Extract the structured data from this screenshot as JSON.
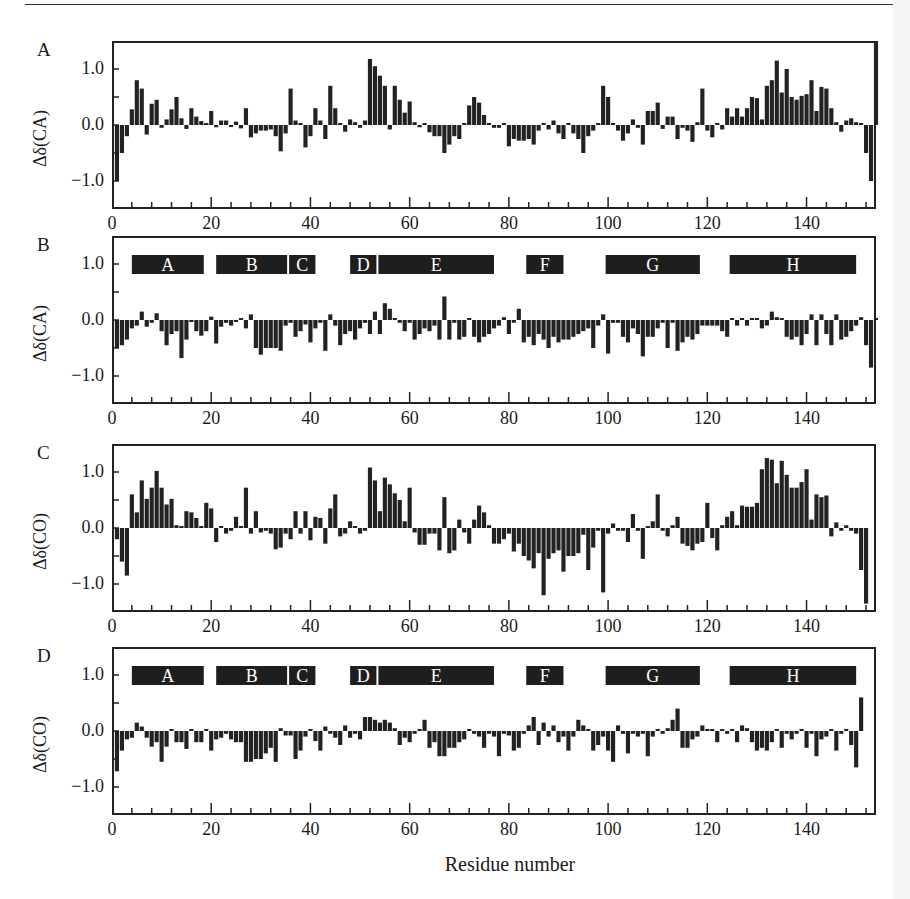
{
  "figure": {
    "xlabel": "Residue number",
    "x_ticks": [
      "0",
      "20",
      "40",
      "60",
      "80",
      "100",
      "120",
      "140"
    ],
    "y_ticks": [
      "1.0",
      "0.0",
      "−1.0"
    ]
  },
  "panels": [
    {
      "label": "A",
      "ylabel": "Δδ(CA)"
    },
    {
      "label": "B",
      "ylabel": "Δδ(CA)"
    },
    {
      "label": "C",
      "ylabel": "Δδ(CO)"
    },
    {
      "label": "D",
      "ylabel": "Δδ(CO)"
    }
  ],
  "helices": [
    {
      "name": "A",
      "start": 4,
      "end": 18.5
    },
    {
      "name": "B",
      "start": 21,
      "end": 35.3
    },
    {
      "name": "C",
      "start": 35.7,
      "end": 41
    },
    {
      "name": "D",
      "start": 48,
      "end": 53.3
    },
    {
      "name": "E",
      "start": 53.7,
      "end": 77
    },
    {
      "name": "F",
      "start": 83.5,
      "end": 91
    },
    {
      "name": "G",
      "start": 99.5,
      "end": 118.5
    },
    {
      "name": "H",
      "start": 124.5,
      "end": 150
    }
  ],
  "chart_data": [
    {
      "type": "bar",
      "title": "A",
      "xlabel": "Residue number",
      "ylabel": "Δδ(CA)",
      "xlim": [
        0,
        154
      ],
      "ylim": [
        -1.5,
        1.5
      ],
      "grid": false,
      "x_start": 1,
      "values": [
        -1.0,
        -0.5,
        -0.2,
        0.28,
        0.8,
        0.65,
        -0.17,
        0.38,
        0.45,
        -0.05,
        0.1,
        0.28,
        0.5,
        0.12,
        -0.07,
        0.3,
        0.15,
        0.07,
        0.0,
        0.25,
        -0.04,
        0.08,
        0.08,
        -0.02,
        0.06,
        -0.06,
        0.3,
        -0.22,
        -0.15,
        -0.1,
        -0.1,
        -0.08,
        -0.2,
        -0.47,
        -0.15,
        0.65,
        0.08,
        0.0,
        -0.4,
        -0.2,
        0.3,
        0.08,
        -0.25,
        0.7,
        0.3,
        0.0,
        -0.12,
        0.1,
        0.05,
        -0.05,
        0.08,
        1.18,
        1.05,
        0.88,
        0.7,
        -0.08,
        0.7,
        0.45,
        0.22,
        0.42,
        0.05,
        -0.04,
        0.02,
        -0.13,
        -0.2,
        -0.2,
        -0.5,
        -0.35,
        -0.2,
        -0.25,
        0.0,
        0.35,
        0.5,
        0.4,
        0.18,
        0.0,
        -0.05,
        -0.05,
        0.0,
        -0.38,
        -0.25,
        -0.28,
        -0.28,
        -0.25,
        -0.35,
        -0.1,
        0.0,
        -0.08,
        0.08,
        -0.15,
        -0.25,
        0.0,
        -0.15,
        -0.25,
        -0.5,
        -0.2,
        -0.1,
        0.0,
        0.7,
        0.5,
        0.0,
        -0.1,
        -0.28,
        -0.15,
        0.1,
        -0.05,
        -0.35,
        0.25,
        0.25,
        0.4,
        -0.07,
        0.15,
        0.15,
        -0.25,
        -0.05,
        -0.1,
        -0.3,
        0.05,
        0.65,
        -0.1,
        -0.22,
        0.02,
        -0.08,
        0.3,
        0.15,
        0.3,
        0.15,
        0.3,
        0.5,
        0.48,
        0.1,
        0.7,
        0.8,
        1.15,
        0.58,
        1.0,
        0.5,
        0.45,
        0.52,
        0.55,
        0.8,
        0.25,
        0.68,
        0.65,
        0.3,
        0.05,
        -0.12,
        0.08,
        0.12,
        0.05,
        0.0,
        -0.5,
        -1.0,
        1.5
      ]
    },
    {
      "type": "bar",
      "title": "B",
      "xlabel": "Residue number",
      "ylabel": "Δδ(CA)",
      "xlim": [
        0,
        154
      ],
      "ylim": [
        -1.5,
        1.5
      ],
      "grid": false,
      "x_start": 1,
      "values": [
        -0.5,
        -0.45,
        -0.35,
        -0.15,
        -0.1,
        0.15,
        -0.12,
        -0.05,
        0.12,
        -0.2,
        -0.45,
        -0.25,
        -0.2,
        -0.68,
        -0.35,
        -0.03,
        -0.2,
        -0.28,
        -0.2,
        0.06,
        -0.42,
        -0.12,
        -0.05,
        -0.1,
        -0.02,
        0.02,
        -0.15,
        0.1,
        -0.5,
        -0.62,
        -0.5,
        -0.5,
        -0.5,
        -0.55,
        -0.1,
        -0.05,
        -0.3,
        -0.2,
        -0.08,
        -0.4,
        -0.15,
        -0.05,
        -0.55,
        0.1,
        -0.1,
        -0.45,
        -0.25,
        -0.2,
        -0.35,
        -0.15,
        -0.05,
        -0.25,
        0.15,
        -0.25,
        0.3,
        0.2,
        0.0,
        -0.05,
        -0.2,
        -0.05,
        -0.35,
        -0.25,
        -0.15,
        -0.2,
        -0.1,
        -0.35,
        0.42,
        -0.35,
        -0.05,
        -0.35,
        -0.3,
        0.0,
        -0.3,
        -0.4,
        -0.3,
        -0.25,
        -0.15,
        -0.1,
        0.05,
        -0.25,
        -0.05,
        0.2,
        -0.4,
        -0.3,
        -0.45,
        -0.25,
        -0.35,
        -0.5,
        -0.3,
        -0.4,
        -0.35,
        -0.35,
        -0.3,
        -0.25,
        -0.2,
        -0.15,
        -0.5,
        -0.1,
        0.1,
        -0.6,
        -0.05,
        -0.05,
        -0.3,
        -0.4,
        -0.15,
        -0.25,
        -0.65,
        -0.3,
        -0.3,
        -0.15,
        -0.05,
        -0.5,
        -0.05,
        -0.55,
        -0.4,
        -0.3,
        -0.35,
        -0.25,
        -0.1,
        -0.1,
        -0.1,
        -0.1,
        -0.2,
        -0.3,
        0.0,
        -0.1,
        0.0,
        -0.1,
        0.0,
        0.0,
        -0.15,
        -0.1,
        0.15,
        0.05,
        0.0,
        -0.3,
        -0.35,
        -0.3,
        -0.45,
        -0.25,
        0.1,
        -0.45,
        0.1,
        -0.25,
        -0.45,
        0.1,
        -0.35,
        -0.3,
        -0.2,
        -0.1,
        0.05,
        -0.45,
        -0.85,
        0.0
      ]
    },
    {
      "type": "bar",
      "title": "C",
      "xlabel": "Residue number",
      "ylabel": "Δδ(CO)",
      "xlim": [
        0,
        154
      ],
      "ylim": [
        -1.5,
        1.5
      ],
      "grid": false,
      "x_start": 1,
      "values": [
        -0.2,
        -0.6,
        -0.85,
        0.6,
        0.28,
        0.85,
        0.52,
        0.72,
        1.02,
        0.72,
        0.42,
        0.52,
        0.05,
        0.0,
        0.3,
        0.28,
        0.18,
        0.0,
        0.45,
        0.35,
        -0.25,
        0.02,
        -0.1,
        -0.05,
        0.2,
        0.0,
        0.72,
        -0.1,
        0.3,
        -0.08,
        -0.05,
        -0.1,
        -0.38,
        -0.35,
        -0.1,
        -0.2,
        0.3,
        -0.1,
        0.3,
        -0.22,
        0.2,
        0.18,
        -0.28,
        0.35,
        0.6,
        -0.15,
        -0.1,
        0.12,
        0.0,
        -0.1,
        -0.05,
        1.08,
        0.85,
        0.3,
        0.9,
        0.78,
        0.62,
        0.5,
        0.12,
        0.72,
        -0.08,
        -0.3,
        -0.3,
        -0.1,
        -0.1,
        -0.4,
        0.55,
        -0.45,
        -0.4,
        0.15,
        -0.08,
        -0.28,
        0.15,
        0.4,
        0.28,
        0.05,
        -0.28,
        -0.28,
        -0.2,
        -0.1,
        -0.42,
        -0.28,
        -0.5,
        -0.58,
        -0.72,
        -0.45,
        -1.2,
        -0.55,
        -0.45,
        -0.4,
        -0.78,
        -0.5,
        -0.5,
        -0.45,
        -0.12,
        -0.75,
        -0.35,
        -0.05,
        -1.15,
        -0.1,
        0.08,
        -0.05,
        -0.05,
        -0.25,
        0.25,
        -0.05,
        -0.55,
        0.0,
        0.12,
        0.6,
        -0.05,
        -0.15,
        0.05,
        0.2,
        -0.28,
        -0.32,
        -0.4,
        -0.28,
        -0.25,
        0.45,
        -0.18,
        -0.4,
        0.05,
        0.2,
        0.3,
        0.05,
        0.4,
        0.38,
        0.38,
        0.45,
        1.05,
        1.25,
        1.22,
        0.8,
        1.2,
        0.95,
        0.72,
        0.72,
        0.82,
        1.05,
        0.15,
        0.6,
        0.55,
        0.58,
        -0.15,
        0.1,
        -0.05,
        0.05,
        -0.05,
        -0.1,
        -0.75,
        -1.35
      ]
    },
    {
      "type": "bar",
      "title": "D",
      "xlabel": "Residue number",
      "ylabel": "Δδ(CO)",
      "xlim": [
        0,
        154
      ],
      "ylim": [
        -1.5,
        1.5
      ],
      "grid": false,
      "x_start": 1,
      "values": [
        -0.72,
        -0.35,
        -0.15,
        -0.12,
        0.15,
        0.08,
        -0.12,
        -0.28,
        -0.2,
        -0.55,
        -0.28,
        0.0,
        -0.2,
        -0.2,
        -0.32,
        0.02,
        -0.2,
        -0.2,
        0.0,
        -0.35,
        -0.15,
        -0.12,
        -0.05,
        -0.15,
        -0.2,
        -0.2,
        -0.55,
        -0.55,
        -0.5,
        -0.5,
        -0.4,
        -0.3,
        -0.55,
        0.05,
        -0.08,
        -0.08,
        -0.5,
        -0.35,
        -0.1,
        0.0,
        -0.18,
        -0.35,
        0.08,
        -0.05,
        -0.12,
        -0.25,
        0.1,
        -0.12,
        -0.05,
        -0.15,
        0.25,
        0.25,
        0.2,
        0.15,
        0.2,
        0.15,
        0.05,
        -0.25,
        -0.12,
        -0.2,
        -0.05,
        0.0,
        0.2,
        -0.3,
        -0.2,
        -0.45,
        -0.45,
        -0.3,
        -0.3,
        -0.2,
        -0.15,
        0.0,
        -0.05,
        -0.1,
        -0.3,
        -0.05,
        -0.1,
        -0.45,
        -0.05,
        -0.08,
        -0.35,
        -0.3,
        -0.05,
        0.1,
        0.25,
        -0.25,
        0.15,
        -0.1,
        0.1,
        -0.2,
        -0.1,
        -0.35,
        -0.1,
        0.2,
        0.1,
        0.0,
        -0.35,
        -0.25,
        -0.1,
        -0.35,
        -0.55,
        0.1,
        -0.05,
        -0.4,
        -0.05,
        -0.1,
        -0.05,
        -0.45,
        -0.1,
        0.0,
        -0.05,
        0.05,
        0.2,
        0.4,
        -0.3,
        -0.3,
        -0.15,
        -0.1,
        0.1,
        0.0,
        0.0,
        -0.2,
        0.0,
        -0.05,
        0.0,
        -0.2,
        0.1,
        0.05,
        -0.2,
        -0.35,
        -0.3,
        -0.35,
        -0.2,
        0.0,
        -0.3,
        -0.05,
        -0.15,
        -0.05,
        0.0,
        -0.3,
        -0.05,
        -0.45,
        -0.15,
        -0.1,
        0.0,
        -0.35,
        -0.05,
        0.0,
        -0.25,
        -0.65,
        0.6
      ]
    }
  ]
}
